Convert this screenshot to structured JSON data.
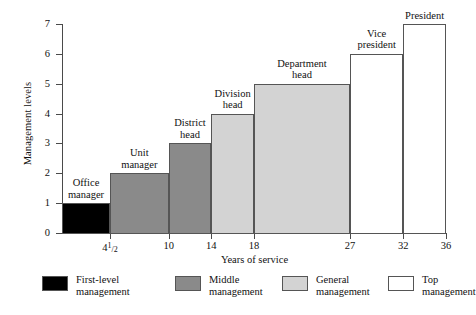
{
  "chart_data": {
    "type": "bar",
    "title": "",
    "xlabel": "Years of service",
    "ylabel": "Management levels",
    "ylim": [
      0,
      7
    ],
    "yticks": [
      0,
      1,
      2,
      3,
      4,
      5,
      6,
      7
    ],
    "xticks": [
      "4½",
      "10",
      "14",
      "18",
      "27",
      "32",
      "36"
    ],
    "xtick_values": [
      4.5,
      10,
      14,
      18,
      27,
      32,
      36
    ],
    "grid": false,
    "legend_position": "bottom",
    "categories": [
      "Office manager",
      "Unit manager",
      "District head",
      "Division head",
      "Department head",
      "Vice president",
      "President"
    ],
    "values": [
      1,
      2,
      3,
      4,
      5,
      6,
      7
    ],
    "series": [
      {
        "name": "Management levels",
        "values": [
          1,
          2,
          3,
          4,
          5,
          6,
          7
        ]
      }
    ],
    "bars": [
      {
        "label": "Office\nmanager",
        "label_line1": "Office",
        "label_line2": "manager",
        "level": 1,
        "start_year": 0,
        "end_year": 4.5,
        "group": "First-level management",
        "color": "#000000"
      },
      {
        "label": "Unit\nmanager",
        "label_line1": "Unit",
        "label_line2": "manager",
        "level": 2,
        "start_year": 4.5,
        "end_year": 10,
        "group": "Middle management",
        "color": "#8a8a8a"
      },
      {
        "label": "District\nhead",
        "label_line1": "District",
        "label_line2": "head",
        "level": 3,
        "start_year": 10,
        "end_year": 14,
        "group": "Middle management",
        "color": "#8a8a8a"
      },
      {
        "label": "Division\nhead",
        "label_line1": "Division",
        "label_line2": "head",
        "level": 4,
        "start_year": 14,
        "end_year": 18,
        "group": "General management",
        "color": "#d3d3d3"
      },
      {
        "label": "Department\nhead",
        "label_line1": "Department",
        "label_line2": "head",
        "level": 5,
        "start_year": 18,
        "end_year": 27,
        "group": "General management",
        "color": "#d3d3d3"
      },
      {
        "label": "Vice\npresident",
        "label_line1": "Vice",
        "label_line2": "president",
        "level": 6,
        "start_year": 27,
        "end_year": 32,
        "group": "Top management",
        "color": "#ffffff"
      },
      {
        "label": "President",
        "label_line1": "President",
        "label_line2": "",
        "level": 7,
        "start_year": 32,
        "end_year": 36,
        "group": "Top management",
        "color": "#ffffff"
      }
    ],
    "legend": [
      {
        "label": "First-level\nmanagement",
        "line1": "First-level",
        "line2": "management",
        "color": "#000000"
      },
      {
        "label": "Middle\nmanagement",
        "line1": "Middle",
        "line2": "management",
        "color": "#8a8a8a"
      },
      {
        "label": "General\nmanagement",
        "line1": "General",
        "line2": "management",
        "color": "#d3d3d3"
      },
      {
        "label": "Top\nmanagement",
        "line1": "Top",
        "line2": "management",
        "color": "#ffffff"
      }
    ]
  }
}
